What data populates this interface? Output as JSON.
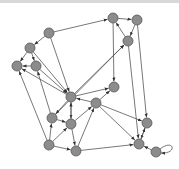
{
  "diagram": {
    "type": "directed-graph",
    "node_fill": "#8c8c8c",
    "node_stroke": "#555555",
    "edge_color": "#555555",
    "node_radius": 5,
    "nodes": [
      {
        "id": "n1",
        "x": 49,
        "y": 33
      },
      {
        "id": "n2",
        "x": 30,
        "y": 48
      },
      {
        "id": "n3",
        "x": 17,
        "y": 66
      },
      {
        "id": "n4",
        "x": 36,
        "y": 66
      },
      {
        "id": "n5",
        "x": 113,
        "y": 18
      },
      {
        "id": "n6",
        "x": 137,
        "y": 20
      },
      {
        "id": "n7",
        "x": 128,
        "y": 41
      },
      {
        "id": "n8",
        "x": 71,
        "y": 97
      },
      {
        "id": "n9",
        "x": 96,
        "y": 103
      },
      {
        "id": "n10",
        "x": 114,
        "y": 87
      },
      {
        "id": "n11",
        "x": 52,
        "y": 118
      },
      {
        "id": "n12",
        "x": 71,
        "y": 124
      },
      {
        "id": "n13",
        "x": 49,
        "y": 145
      },
      {
        "id": "n14",
        "x": 76,
        "y": 151
      },
      {
        "id": "n15",
        "x": 147,
        "y": 123
      },
      {
        "id": "n16",
        "x": 139,
        "y": 144
      },
      {
        "id": "n17",
        "x": 156,
        "y": 152
      }
    ],
    "edges": [
      {
        "from": "n1",
        "to": "n5"
      },
      {
        "from": "n1",
        "to": "n2"
      },
      {
        "from": "n2",
        "to": "n3"
      },
      {
        "from": "n4",
        "to": "n3"
      },
      {
        "from": "n2",
        "to": "n4"
      },
      {
        "from": "n1",
        "to": "n8"
      },
      {
        "from": "n2",
        "to": "n8"
      },
      {
        "from": "n5",
        "to": "n6"
      },
      {
        "from": "n7",
        "to": "n5"
      },
      {
        "from": "n6",
        "to": "n7"
      },
      {
        "from": "n5",
        "to": "n10"
      },
      {
        "from": "n7",
        "to": "n16"
      },
      {
        "from": "n6",
        "to": "n15"
      },
      {
        "from": "n8",
        "to": "n7"
      },
      {
        "from": "n11",
        "to": "n7"
      },
      {
        "from": "n4",
        "to": "n8"
      },
      {
        "from": "n8",
        "to": "n10"
      },
      {
        "from": "n9",
        "to": "n8"
      },
      {
        "from": "n8",
        "to": "n11"
      },
      {
        "from": "n8",
        "to": "n12"
      },
      {
        "from": "n12",
        "to": "n8"
      },
      {
        "from": "n11",
        "to": "n12"
      },
      {
        "from": "n12",
        "to": "n9"
      },
      {
        "from": "n9",
        "to": "n10"
      },
      {
        "from": "n9",
        "to": "n15"
      },
      {
        "from": "n9",
        "to": "n16"
      },
      {
        "from": "n12",
        "to": "n14"
      },
      {
        "from": "n13",
        "to": "n11"
      },
      {
        "from": "n13",
        "to": "n12"
      },
      {
        "from": "n13",
        "to": "n14"
      },
      {
        "from": "n13",
        "to": "n3"
      },
      {
        "from": "n11",
        "to": "n4"
      },
      {
        "from": "n14",
        "to": "n16"
      },
      {
        "from": "n14",
        "to": "n9"
      },
      {
        "from": "n15",
        "to": "n16"
      },
      {
        "from": "n16",
        "to": "n15"
      },
      {
        "from": "n17",
        "to": "n16"
      },
      {
        "from": "n8",
        "to": "n3"
      }
    ],
    "self_loops": [
      {
        "node": "n17"
      }
    ]
  }
}
